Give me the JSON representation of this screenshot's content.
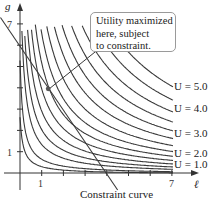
{
  "chart_data": {
    "type": "line",
    "title": "",
    "xlabel": "ℓ",
    "ylabel": "g",
    "xlim": [
      0,
      8
    ],
    "ylim": [
      0,
      7.5
    ],
    "grid": false,
    "x_ticks": [
      1,
      2,
      3,
      4,
      5,
      6,
      7
    ],
    "x_tick_labels": [
      "1",
      "",
      "",
      "",
      "",
      "",
      "7"
    ],
    "y_ticks": [
      1,
      2,
      3,
      4,
      5,
      6,
      7
    ],
    "y_tick_labels": [
      "1",
      "",
      "",
      "",
      "",
      "",
      "7"
    ],
    "indifference_curves": {
      "form": "(l + 0.15) * (g + 0.05) = k",
      "k_values": [
        0.4,
        0.8,
        1.6,
        2.4,
        3.4,
        4.6,
        6.0,
        7.6,
        9.6,
        12.0,
        14.6,
        17.6,
        21.0,
        25.0,
        29.5
      ],
      "labeled": [
        {
          "label": "U = 1.0",
          "k": 3.4
        },
        {
          "label": "U = 2.0",
          "k": 6.0
        },
        {
          "label": "U = 3.0",
          "k": 12.0
        },
        {
          "label": "U = 4.0",
          "k": 21.0
        },
        {
          "label": "U = 5.0",
          "k": 29.5
        }
      ]
    },
    "constraint": {
      "label": "Constraint curve",
      "points": [
        [
          -0.9,
          7.3
        ],
        [
          4.5,
          -0.8
        ]
      ],
      "equation": "g = 6 - 1.5ℓ"
    },
    "optimum_point": {
      "l": 1.3,
      "g": 3.95
    },
    "annotation": {
      "lines": [
        "Utility maximized",
        "here, subject",
        "to constraint."
      ]
    }
  },
  "axes": {
    "x_label": "ℓ",
    "y_label": "g"
  },
  "labels": {
    "u5": "U = 5.0",
    "u4": "U = 4.0",
    "u3": "U = 3.0",
    "u2": "U = 2.0",
    "u1": "U = 1.0",
    "constraint": "Constraint curve",
    "tick_x1": "1",
    "tick_x7": "7",
    "tick_y1": "1",
    "tick_y7": "7"
  },
  "callout": {
    "line1": "Utility maximized",
    "line2": "here, subject",
    "line3": "to constraint."
  },
  "colors": {
    "curve": "#3a3a3a",
    "axis": "#333333",
    "point": "#555555",
    "box_border": "#9a9a9a"
  }
}
